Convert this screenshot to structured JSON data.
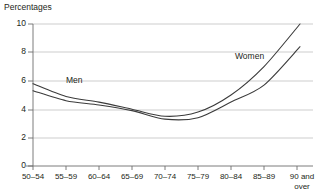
{
  "chart_data": {
    "type": "line",
    "title": "Percentages",
    "xlabel": "",
    "ylabel": "Percentages",
    "ylim": [
      0,
      10
    ],
    "yticks": [
      0,
      2,
      4,
      6,
      8,
      10
    ],
    "ytick_labels": [
      "0",
      "2",
      "4",
      "6",
      "8",
      "10"
    ],
    "grid": true,
    "grid_axis": "y",
    "legend_position": "inline-annotation",
    "categories": [
      "50–54",
      "55–59",
      "60–64",
      "65–69",
      "70–74",
      "75–79",
      "80–84",
      "85–89",
      "90 and\nover"
    ],
    "series": [
      {
        "name": "Women",
        "color": "#3b3b3b",
        "values": [
          5.8,
          4.9,
          4.5,
          4.0,
          3.5,
          3.8,
          5.0,
          7.0,
          10.0
        ]
      },
      {
        "name": "Men",
        "color": "#3b3b3b",
        "values": [
          5.3,
          4.6,
          4.3,
          3.9,
          3.3,
          3.4,
          4.5,
          5.7,
          8.4
        ]
      }
    ],
    "annotations": [
      {
        "text": "Men",
        "x_category": "60–64",
        "value": 5.2
      },
      {
        "text": "Women",
        "x_category": "85–89",
        "value": 7.6
      }
    ]
  },
  "axis": {
    "y_ticks": [
      {
        "label": "10",
        "y": 24
      },
      {
        "label": "8",
        "y": 52
      },
      {
        "label": "6",
        "y": 81
      },
      {
        "label": "4",
        "y": 110
      },
      {
        "label": "2",
        "y": 138
      },
      {
        "label": "0",
        "y": 166
      }
    ],
    "x_ticks": [
      {
        "label": "50–54",
        "x": 33
      },
      {
        "label": "55–59",
        "x": 66
      },
      {
        "label": "60–64",
        "x": 99
      },
      {
        "label": "65–69",
        "x": 132
      },
      {
        "label": "70–74",
        "x": 165
      },
      {
        "label": "75–79",
        "x": 198
      },
      {
        "label": "80–84",
        "x": 231
      },
      {
        "label": "85–89",
        "x": 264
      },
      {
        "label": "90 and\nover",
        "x": 300
      }
    ]
  },
  "labels": {
    "men": "Men",
    "women": "Women"
  },
  "colors": {
    "line": "#3b3b3b",
    "grid": "#b8b8b8",
    "axis": "#6e6e6e",
    "text": "#231f20",
    "background": "#ffffff"
  }
}
